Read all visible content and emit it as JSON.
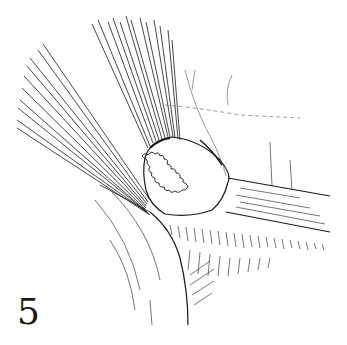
{
  "figure": {
    "label": "5",
    "colors": {
      "ink": "#1a1a1a",
      "light_ink": "#555555",
      "background": "#ffffff"
    }
  }
}
